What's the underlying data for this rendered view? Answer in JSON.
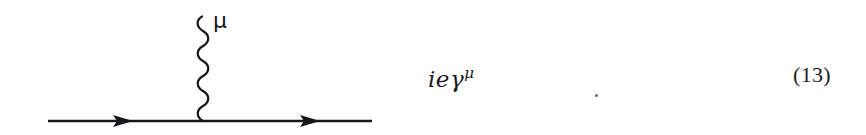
{
  "page": {
    "background_color": "#ffffff",
    "width": 866,
    "height": 135,
    "ink_color": "#16161a"
  },
  "figure": {
    "name": "qed-vertex-feynman-diagram",
    "fermion_line": {
      "start_x": 48,
      "end_x": 372,
      "y": 121,
      "stroke_width": 2.4,
      "color": "#17171b",
      "arrow_count": 2,
      "arrow_tips_x": [
        133,
        320
      ],
      "arrow_half_height": 6,
      "arrow_length": 20,
      "direction": "right"
    },
    "photon_line": {
      "center_x": 203,
      "top_y": 16,
      "bottom_y": 121,
      "amplitude": 8,
      "wavelength": 15,
      "stroke_width": 2.2,
      "color": "#17171b",
      "style": "wavy"
    },
    "vertex": {
      "x": 203,
      "y": 121
    },
    "photon_label": "μ"
  },
  "expression": {
    "prefix": "ieγ",
    "superscript": "μ",
    "full_text": "ieγμ"
  },
  "equation_number": "(13)",
  "stray_mark": {
    "name": "stray-ink-dot",
    "x": 595,
    "y": 94,
    "color": "#4a4a4e"
  }
}
